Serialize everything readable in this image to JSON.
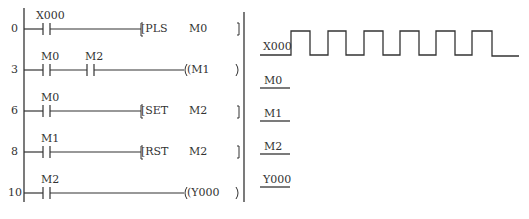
{
  "ladder": {
    "rungs": [
      {
        "step": "0",
        "contacts": [
          {
            "label": "X000"
          }
        ],
        "instruction": {
          "type": "function",
          "op": "[PLS",
          "operand": "M0",
          "close": "]"
        }
      },
      {
        "step": "3",
        "contacts": [
          {
            "label": "M0"
          },
          {
            "label": "M2"
          }
        ],
        "instruction": {
          "type": "coil",
          "op": "(M1",
          "operand": "",
          "close": ")"
        }
      },
      {
        "step": "6",
        "contacts": [
          {
            "label": "M0"
          }
        ],
        "instruction": {
          "type": "function",
          "op": "[SET",
          "operand": "M2",
          "close": "]"
        }
      },
      {
        "step": "8",
        "contacts": [
          {
            "label": "M1"
          }
        ],
        "instruction": {
          "type": "function",
          "op": "[RST",
          "operand": "M2",
          "close": "]"
        }
      },
      {
        "step": "10",
        "contacts": [
          {
            "label": "M2"
          }
        ],
        "instruction": {
          "type": "coil",
          "op": "(Y000",
          "operand": "",
          "close": ")"
        }
      }
    ]
  },
  "timing": {
    "signals": [
      {
        "name": "X000",
        "waveform": "pulse-train",
        "pulses": 6
      },
      {
        "name": "M0",
        "waveform": "blank"
      },
      {
        "name": "M1",
        "waveform": "blank"
      },
      {
        "name": "M2",
        "waveform": "blank"
      },
      {
        "name": "Y000",
        "waveform": "blank"
      }
    ]
  },
  "colors": {
    "line": "#333333",
    "background": "#ffffff"
  }
}
